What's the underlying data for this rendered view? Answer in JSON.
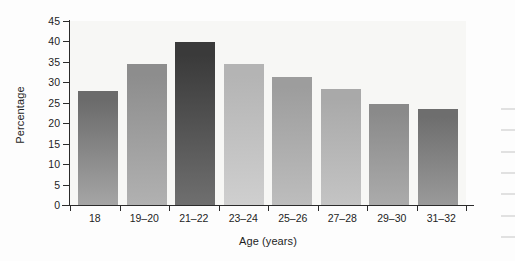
{
  "chart_data": {
    "type": "bar",
    "title": "",
    "xlabel": "Age (years)",
    "ylabel": "Percentage",
    "categories": [
      "18",
      "19–20",
      "21–22",
      "23–24",
      "25–26",
      "27–28",
      "29–30",
      "31–32"
    ],
    "values": [
      27.8,
      34.4,
      39.8,
      34.4,
      31.3,
      28.4,
      24.6,
      23.4
    ],
    "ylim": [
      0,
      45
    ],
    "ytick_labels": [
      "45",
      "40",
      "35",
      "30",
      "25",
      "20",
      "15",
      "10",
      "5",
      "0"
    ],
    "ytick_values": [
      45,
      40,
      35,
      30,
      25,
      20,
      15,
      10,
      5,
      0
    ],
    "grid": false,
    "legend": "none",
    "bar_colors": [
      "#6b6b6b",
      "#8d8d8d",
      "#3a3a3a",
      "#b4b4b4",
      "#9d9d9d",
      "#a9a9a9",
      "#8a8a8a",
      "#6e6e6e"
    ],
    "bar_colors_bottom": [
      "#a5a5a5",
      "#b1b1b1",
      "#6f6f6f",
      "#cfcfcf",
      "#bdbdbd",
      "#c4c4c4",
      "#ababab",
      "#9a9a9a"
    ],
    "plot_background": "#f7f7f5",
    "axis_color": "#2b2b2b"
  }
}
